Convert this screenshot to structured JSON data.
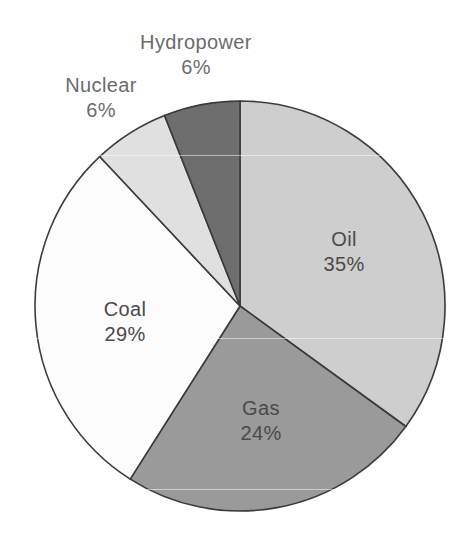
{
  "chart_data": {
    "type": "pie",
    "title": "",
    "subtitle": "",
    "xlabel": "",
    "ylabel": "",
    "legend_position": "none",
    "grid": false,
    "labels_on_slices": true,
    "start_angle_deg": 0,
    "direction": "clockwise",
    "categories": [
      "Oil",
      "Gas",
      "Coal",
      "Nuclear",
      "Hydropower"
    ],
    "values": [
      35,
      24,
      29,
      6,
      6
    ],
    "unit": "%",
    "slices": [
      {
        "name": "Oil",
        "value": 35,
        "value_text": "35%",
        "color": "#cecece",
        "label_placement": "inside",
        "label_x": 344,
        "label_y": 227
      },
      {
        "name": "Gas",
        "value": 24,
        "value_text": "24%",
        "color": "#9a9a9a",
        "label_placement": "inside",
        "label_x": 261,
        "label_y": 396
      },
      {
        "name": "Coal",
        "value": 29,
        "value_text": "29%",
        "color": "#fcfcfc",
        "label_placement": "inside",
        "label_x": 125,
        "label_y": 297
      },
      {
        "name": "Nuclear",
        "value": 6,
        "value_text": "6%",
        "color": "#e0e0e0",
        "label_placement": "outside",
        "label_x": 101,
        "label_y": 73
      },
      {
        "name": "Hydropower",
        "value": 6,
        "value_text": "6%",
        "color": "#6e6e6e",
        "label_placement": "outside",
        "label_x": 196,
        "label_y": 30
      }
    ],
    "geometry": {
      "center_x": 240,
      "center_y": 306,
      "radius": 205
    },
    "stroke_color": "#3b3b3b",
    "background": "#ffffff"
  }
}
